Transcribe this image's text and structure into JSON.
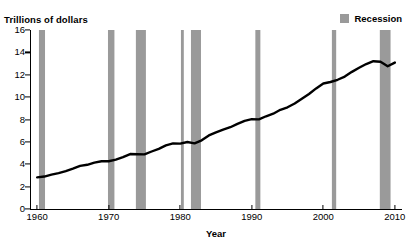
{
  "chart_data": {
    "type": "line",
    "title": "",
    "subtitle": "",
    "ylabel": "Trillions of dollars",
    "xlabel": "Year",
    "xlim": [
      1959,
      2011
    ],
    "ylim": [
      0,
      16
    ],
    "xticks": [
      1960,
      1970,
      1980,
      1990,
      2000,
      2010
    ],
    "yticks": [
      0,
      2,
      4,
      6,
      8,
      10,
      12,
      14,
      16
    ],
    "grid": false,
    "legend": {
      "position": "top-right",
      "entries": [
        {
          "label": "Recession",
          "color": "#9a9a9a",
          "marker": "square"
        }
      ]
    },
    "line_color": "#000000",
    "line_width": 2.4,
    "series": [
      {
        "name": "Gross Domestic Product",
        "x": [
          1960,
          1961,
          1962,
          1963,
          1964,
          1965,
          1966,
          1967,
          1968,
          1969,
          1970,
          1971,
          1972,
          1973,
          1974,
          1975,
          1976,
          1977,
          1978,
          1979,
          1980,
          1981,
          1982,
          1983,
          1984,
          1985,
          1986,
          1987,
          1988,
          1989,
          1990,
          1991,
          1992,
          1993,
          1994,
          1995,
          1996,
          1997,
          1998,
          1999,
          2000,
          2001,
          2002,
          2003,
          2004,
          2005,
          2006,
          2007,
          2008,
          2009,
          2010
        ],
        "values": [
          2.83,
          2.9,
          3.07,
          3.21,
          3.39,
          3.61,
          3.85,
          3.95,
          4.14,
          4.27,
          4.27,
          4.41,
          4.64,
          4.91,
          4.89,
          4.88,
          5.14,
          5.38,
          5.68,
          5.86,
          5.84,
          5.99,
          5.87,
          6.14,
          6.58,
          6.85,
          7.09,
          7.31,
          7.61,
          7.88,
          8.03,
          8.01,
          8.29,
          8.52,
          8.87,
          9.09,
          9.43,
          9.85,
          10.28,
          10.78,
          11.22,
          11.35,
          11.55,
          11.84,
          12.26,
          12.62,
          12.96,
          13.21,
          13.16,
          12.76,
          13.09
        ],
        "units": "trillions of chained dollars"
      }
    ],
    "recession_bands": [
      {
        "start": 1960.25,
        "end": 1961.1,
        "label": "1960-1961 recession"
      },
      {
        "start": 1969.9,
        "end": 1970.8,
        "label": "1969-1970 recession"
      },
      {
        "start": 1973.8,
        "end": 1975.2,
        "label": "1973-1975 recession"
      },
      {
        "start": 1980.1,
        "end": 1980.5,
        "label": "1980 recession"
      },
      {
        "start": 1981.5,
        "end": 1982.9,
        "label": "1981-1982 recession"
      },
      {
        "start": 1990.5,
        "end": 1991.2,
        "label": "1990-1991 recession"
      },
      {
        "start": 2001.2,
        "end": 2001.8,
        "label": "2001 recession"
      },
      {
        "start": 2007.9,
        "end": 2009.4,
        "label": "2007-2009 recession"
      }
    ],
    "recession_color": "#9a9a9a",
    "axis_color": "#000000",
    "background_color": "#ffffff"
  },
  "axes": {
    "ylabel": "Trillions of dollars",
    "xlabel": "Year",
    "ytick_labels": [
      "0",
      "2",
      "4",
      "6",
      "8",
      "10",
      "12",
      "14",
      "16"
    ],
    "xtick_labels": [
      "1960",
      "1970",
      "1980",
      "1990",
      "2000",
      "2010"
    ]
  },
  "legend": {
    "recession_label": "Recession"
  }
}
